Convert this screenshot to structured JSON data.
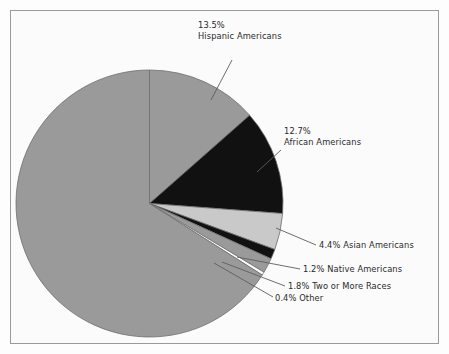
{
  "chart_data": {
    "type": "pie",
    "title": "",
    "subtitle": "",
    "xlabel": "",
    "ylabel": "",
    "legend_position": "none",
    "grid": false,
    "start_angle_deg": 0,
    "direction": "clockwise",
    "categories": [
      "Hispanic Americans",
      "African Americans",
      "Asian Americans",
      "Native Americans",
      "Two or More Races",
      "Other",
      "White Americans"
    ],
    "values": [
      13.5,
      12.7,
      4.4,
      1.2,
      1.8,
      0.4,
      66.0
    ],
    "units": "percent",
    "slices": [
      {
        "name": "Hispanic Americans",
        "percent": 13.5,
        "percent_label": "13.5%",
        "color": "#9a9a9a",
        "labeled": true,
        "label_lines": [
          "13.5%",
          "Hispanic Americans"
        ]
      },
      {
        "name": "African Americans",
        "percent": 12.7,
        "percent_label": "12.7%",
        "color": "#111111",
        "labeled": true,
        "label_lines": [
          "12.7%",
          "African Americans"
        ]
      },
      {
        "name": "Asian Americans",
        "percent": 4.4,
        "percent_label": "4.4%",
        "color": "#c9c9c9",
        "labeled": true,
        "label_lines": [
          "4.4% Asian Americans"
        ]
      },
      {
        "name": "Native Americans",
        "percent": 1.2,
        "percent_label": "1.2%",
        "color": "#111111",
        "labeled": true,
        "label_lines": [
          "1.2% Native Americans"
        ]
      },
      {
        "name": "Two or More Races",
        "percent": 1.8,
        "percent_label": "1.8%",
        "color": "#9a9a9a",
        "labeled": true,
        "label_lines": [
          "1.8% Two or More Races"
        ]
      },
      {
        "name": "Other",
        "percent": 0.4,
        "percent_label": "0.4%",
        "color": "#fbfbfb",
        "labeled": true,
        "label_lines": [
          "0.4% Other"
        ]
      },
      {
        "name": "White Americans",
        "percent": 66.0,
        "percent_label": "",
        "color": "#9a9a9a",
        "labeled": false,
        "label_lines": []
      }
    ]
  },
  "labels": {
    "hispanic": {
      "percent": "13.5%",
      "name": "Hispanic Americans"
    },
    "african": {
      "percent": "12.7%",
      "name": "African Americans"
    },
    "asian": {
      "text": "4.4% Asian Americans"
    },
    "native": {
      "text": "1.2% Native Americans"
    },
    "two_or_more": {
      "text": "1.8% Two or More Races"
    },
    "other": {
      "text": "0.4% Other"
    }
  },
  "colors": {
    "background": "#fbfbfb",
    "frame_border": "#9a9a9a",
    "slice_gray": "#9a9a9a",
    "slice_black": "#111111",
    "slice_light_gray": "#c9c9c9",
    "slice_white": "#fbfbfb",
    "slice_outline": "#6e6e6e",
    "leader_line": "#5d5d5d",
    "text": "#2a2a2a"
  }
}
